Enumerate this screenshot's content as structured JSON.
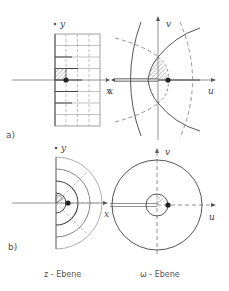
{
  "figure": {
    "panel_a": {
      "label": "a)",
      "z_plane": {
        "x_axis": "x",
        "y_axis": "y"
      },
      "w_plane": {
        "u_axis": "u",
        "v_axis": "v",
        "cut_label": "x"
      }
    },
    "panel_b": {
      "label": "b)",
      "z_plane": {
        "x_axis": "x",
        "y_axis": "y"
      },
      "w_plane": {
        "u_axis": "u",
        "v_axis": "v"
      }
    },
    "captions": {
      "z_plane": "z - Ebene",
      "w_plane": "ω - Ebene"
    }
  },
  "colors": {
    "line": "#555555",
    "light_line": "#999999",
    "hatch": "#888888",
    "dot": "#222222"
  }
}
